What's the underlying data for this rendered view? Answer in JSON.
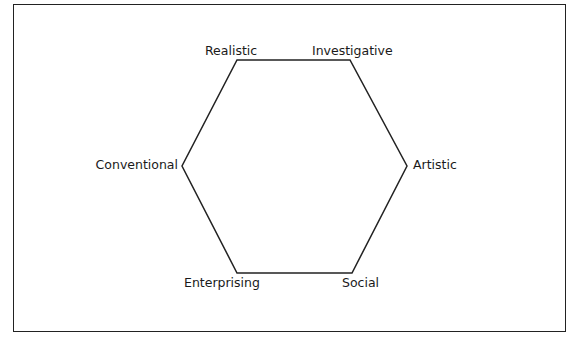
{
  "diagram": {
    "type": "hexagon",
    "stroke_color": "#222222",
    "labels": {
      "realistic": "Realistic",
      "investigative": "Investigative",
      "artistic": "Artistic",
      "social": "Social",
      "enterprising": "Enterprising",
      "conventional": "Conventional"
    }
  }
}
